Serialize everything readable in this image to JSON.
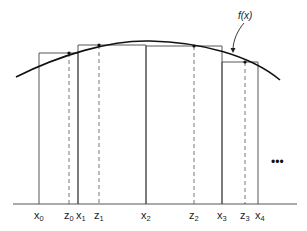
{
  "diagram": {
    "title": "",
    "function_label": "f(x)",
    "ellipsis": "•••",
    "baseline": {
      "x1": 13,
      "x2": 297,
      "y": 204
    },
    "curve": {
      "path": "M16,77 C60,55 110,40 150,41 C200,42 250,55 280,80"
    },
    "rectangles": [
      {
        "x_left": 39,
        "x_right": 78,
        "top": 53
      },
      {
        "x_left": 78,
        "x_right": 146,
        "top": 45
      },
      {
        "x_left": 146,
        "x_right": 222,
        "top": 46
      },
      {
        "x_left": 222,
        "x_right": 258,
        "top": 62
      }
    ],
    "sample_points": [
      {
        "x": 69,
        "y": 53
      },
      {
        "x": 99,
        "y": 45
      },
      {
        "x": 194,
        "y": 46
      },
      {
        "x": 245,
        "y": 62
      }
    ],
    "x_labels": [
      {
        "base": "x",
        "sub": "0",
        "x": 39
      },
      {
        "base": "x",
        "sub": "1",
        "x": 81
      },
      {
        "base": "x",
        "sub": "2",
        "x": 146
      },
      {
        "base": "x",
        "sub": "3",
        "x": 222
      },
      {
        "base": "x",
        "sub": "4",
        "x": 260
      }
    ],
    "z_labels": [
      {
        "base": "z",
        "sub": "0",
        "x": 69
      },
      {
        "base": "z",
        "sub": "1",
        "x": 99
      },
      {
        "base": "z",
        "sub": "2",
        "x": 194
      },
      {
        "base": "z",
        "sub": "3",
        "x": 245
      }
    ]
  }
}
